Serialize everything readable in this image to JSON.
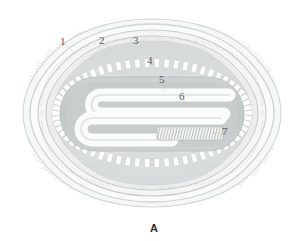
{
  "figure": {
    "caption": "A",
    "labels": [
      {
        "id": "1",
        "text": "1",
        "x": 60,
        "y": 36,
        "target": "outer-spike-envelope"
      },
      {
        "id": "2",
        "text": "2",
        "x": 99,
        "y": 35,
        "target": "outer-membrane"
      },
      {
        "id": "3",
        "text": "3",
        "x": 133,
        "y": 35,
        "target": "surface-tubule-layer"
      },
      {
        "id": "4",
        "text": "4",
        "x": 147,
        "y": 55,
        "target": "lateral-body"
      },
      {
        "id": "5",
        "text": "5",
        "x": 159,
        "y": 74,
        "target": "palisade-core-wall"
      },
      {
        "id": "6",
        "text": "6",
        "x": 179,
        "y": 91,
        "target": "core-matrix"
      },
      {
        "id": "7",
        "text": "7",
        "x": 222,
        "y": 126,
        "target": "nucleoprotein-dna-fiber"
      }
    ]
  },
  "colors": {
    "background": "#ffffff",
    "spike_stroke": "#d9dcdc",
    "membrane_light": "#f2f3f3",
    "membrane_mid": "#dfe2e2",
    "membrane_dark": "#c9cdcd",
    "lateral_body": "#dadede",
    "palisade_fill": "#ffffff",
    "palisade_stroke": "#c6caca",
    "core_fill": "#c3c8c8",
    "core_inner": "#cfd4d4",
    "dna_white": "#fbfcfc",
    "dna_stripe": "#b7bcbc",
    "hatch_tube": "#b9bebe",
    "label_text": "#5a5a5a",
    "caption_text": "#2b2b2b",
    "leader_line": "#b9bdbd"
  },
  "geometry": {
    "outer_rx": 140,
    "outer_ry": 98,
    "center_x": 152,
    "center_y": 113,
    "spike_count": 170,
    "palisade_bricks_top": 27,
    "palisade_bricks_bottom": 27,
    "hatch_lines": 22
  }
}
